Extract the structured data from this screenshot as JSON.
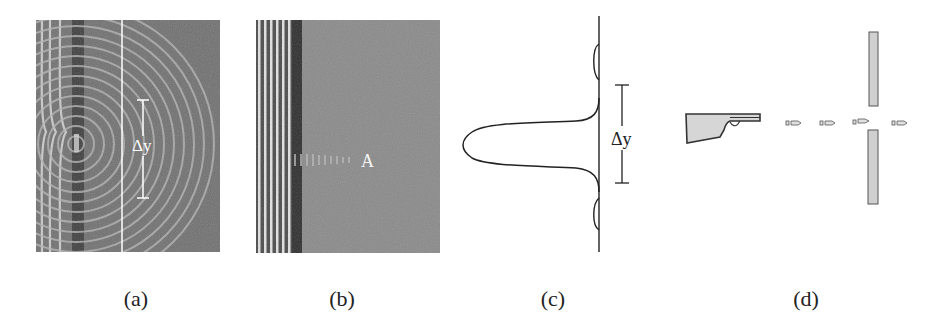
{
  "figure": {
    "panels": [
      {
        "id": "a",
        "caption": "(a)",
        "description": "Water-wave ripple tank: plane waves through narrow slit producing circular diffraction",
        "label": "Δy",
        "colors": {
          "background": "#6f6f6f",
          "band_dark": "#3c3c3c",
          "wave_light": "#c8c8c8",
          "line": "#ffffff"
        }
      },
      {
        "id": "b",
        "caption": "(b)",
        "description": "Ripple tank: plane waves through wide opening, little diffraction",
        "label": "A",
        "colors": {
          "background": "#8a8a8a",
          "band_dark": "#3a3a3a",
          "wave_light": "#e0e0e0"
        }
      },
      {
        "id": "c",
        "caption": "(c)",
        "description": "Intensity profile of diffraction pattern with central maximum width",
        "label": "Δy",
        "colors": {
          "curve": "#222222"
        }
      },
      {
        "id": "d",
        "caption": "(d)",
        "description": "Gun firing bullets through a slit",
        "colors": {
          "fill": "#d4d4d4",
          "outline": "#333333"
        }
      }
    ]
  }
}
